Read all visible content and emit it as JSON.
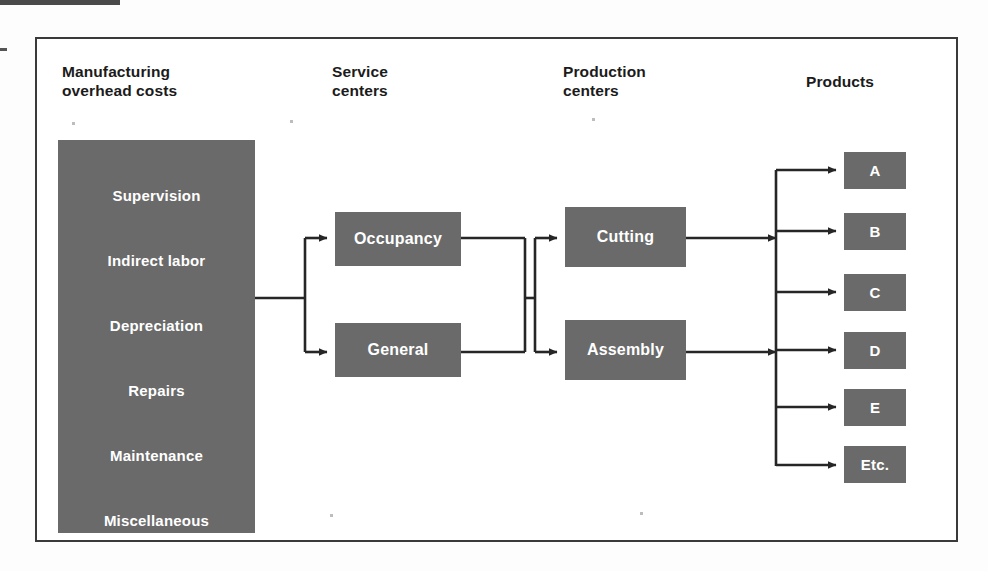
{
  "diagram": {
    "columns": [
      {
        "id": "overhead",
        "label_line1": "Manufacturing",
        "label_line2": "overhead costs"
      },
      {
        "id": "service",
        "label_line1": "Service",
        "label_line2": "centers"
      },
      {
        "id": "production",
        "label_line1": "Production",
        "label_line2": "centers"
      },
      {
        "id": "products",
        "label_line1": "Products",
        "label_line2": ""
      }
    ],
    "overhead_costs": [
      "Supervision",
      "Indirect labor",
      "Depreciation",
      "Repairs",
      "Maintenance",
      "Miscellaneous"
    ],
    "service_centers": [
      "Occupancy",
      "General"
    ],
    "production_centers": [
      "Cutting",
      "Assembly"
    ],
    "products": [
      "A",
      "B",
      "C",
      "D",
      "E",
      "Etc."
    ],
    "colors": {
      "box_fill": "#6a6a6a",
      "box_text": "#ffffff",
      "line": "#262626",
      "frame": "#3a3a3a",
      "page": "#ffffff"
    },
    "flows": [
      {
        "from": "overhead",
        "to": "Occupancy"
      },
      {
        "from": "overhead",
        "to": "General"
      },
      {
        "from": "Occupancy",
        "to": "production-bus"
      },
      {
        "from": "General",
        "to": "production-bus"
      },
      {
        "from": "production-bus",
        "to": "Cutting"
      },
      {
        "from": "production-bus",
        "to": "Assembly"
      },
      {
        "from": "Cutting",
        "to": "products-bus"
      },
      {
        "from": "Assembly",
        "to": "products-bus"
      },
      {
        "from": "products-bus",
        "to": "A"
      },
      {
        "from": "products-bus",
        "to": "B"
      },
      {
        "from": "products-bus",
        "to": "C"
      },
      {
        "from": "products-bus",
        "to": "D"
      },
      {
        "from": "products-bus",
        "to": "E"
      },
      {
        "from": "products-bus",
        "to": "Etc."
      }
    ]
  }
}
